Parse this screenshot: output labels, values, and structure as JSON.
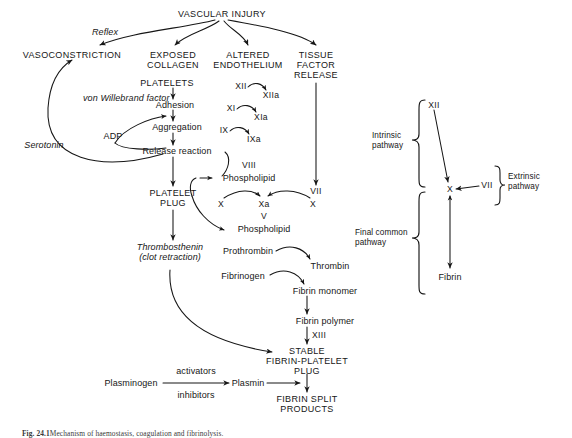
{
  "figure": {
    "caption_prefix": "Fig. 24.1",
    "caption_text": "Mechanism of haemostasis, coagulation and fibrinolysis."
  },
  "left_panel": {
    "vascular_injury": "VASCULAR INJURY",
    "reflex": "Reflex",
    "vasoconstriction": "VASOCONSTRICTION",
    "exposed_collagen_1": "EXPOSED",
    "exposed_collagen_2": "COLLAGEN",
    "altered_endothelium_1": "ALTERED",
    "altered_endothelium_2": "ENDOTHELIUM",
    "tissue_factor_1": "TISSUE",
    "tissue_factor_2": "FACTOR",
    "tissue_factor_3": "RELEASE",
    "platelets": "PLATELETS",
    "von_willebrand": "von Willebrand factor",
    "adhesion": "Adhesion",
    "adp": "ADP",
    "aggregation": "Aggregation",
    "serotonin": "Serotonin",
    "release_reaction": "Release reaction",
    "platelet_plug_1": "PLATELET",
    "platelet_plug_2": "PLUG",
    "thrombosthenin": "Thrombosthenin",
    "clot_retraction": "(clot retraction)"
  },
  "cascade": {
    "f12": "XII",
    "f12a": "XIIa",
    "f11": "XI",
    "f11a": "XIa",
    "f9": "IX",
    "f9a": "IXa",
    "f8": "VIII",
    "phospholipid_upper": "Phospholipid",
    "f7": "VII",
    "f10_left": "X",
    "f10a": "Xa",
    "f10_right": "X",
    "f5": "V",
    "phospholipid_lower": "Phospholipid",
    "prothrombin": "Prothrombin",
    "thrombin": "Thrombin",
    "fibrinogen": "Fibrinogen",
    "fibrin_monomer": "Fibrin monomer",
    "fibrin_polymer": "Fibrin polymer",
    "f13": "XIII",
    "stable": "STABLE",
    "fibrin_platelet": "FIBRIN-PLATELET",
    "plug": "PLUG"
  },
  "fibrinolysis": {
    "plasminogen": "Plasminogen",
    "activators": "activators",
    "inhibitors": "inhibitors",
    "plasmin": "Plasmin",
    "fibrin_split_1": "FIBRIN SPLIT",
    "fibrin_split_2": "PRODUCTS"
  },
  "right_panel": {
    "f12": "XII",
    "f10": "X",
    "f7": "VII",
    "fibrin": "Fibrin",
    "intrinsic_1": "Intrinsic",
    "intrinsic_2": "pathway",
    "extrinsic_1": "Extrinsic",
    "extrinsic_2": "pathway",
    "final_common_1": "Final common",
    "final_common_2": "pathway"
  },
  "colors": {
    "ink": "#161616",
    "background": "#ffffff",
    "caption": "#3a3a3a"
  }
}
